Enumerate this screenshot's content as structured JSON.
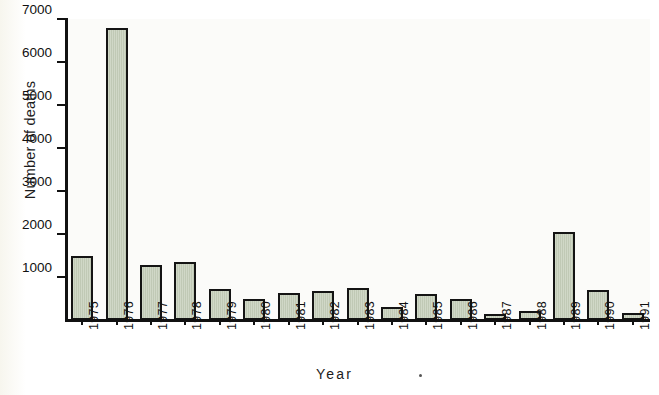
{
  "chart_data": {
    "type": "bar",
    "title": "",
    "xlabel": "Year",
    "ylabel": "Number of deaths",
    "categories": [
      "1975",
      "1976",
      "1977",
      "1978",
      "1979",
      "1980",
      "1981",
      "1982",
      "1983",
      "1984",
      "1985",
      "1986",
      "1987",
      "1988",
      "1989",
      "1990",
      "1991"
    ],
    "values": [
      1480,
      6780,
      1270,
      1360,
      720,
      480,
      630,
      670,
      740,
      310,
      610,
      500,
      130,
      200,
      2040,
      690,
      160
    ],
    "ylim": [
      0,
      7000
    ],
    "ytick_labels": [
      "1000",
      "2000",
      "3000",
      "4000",
      "5000",
      "6000",
      "7000"
    ],
    "ytick_values": [
      1000,
      2000,
      3000,
      4000,
      5000,
      6000,
      7000
    ],
    "grid": false,
    "legend": "none",
    "bar_fill_color": "#c6cfbb",
    "bar_edge_color": "#141414",
    "background_color": "#fbfbf9",
    "axis_color": "#111111"
  },
  "annotations": {
    "xlabel_speck": "·"
  }
}
